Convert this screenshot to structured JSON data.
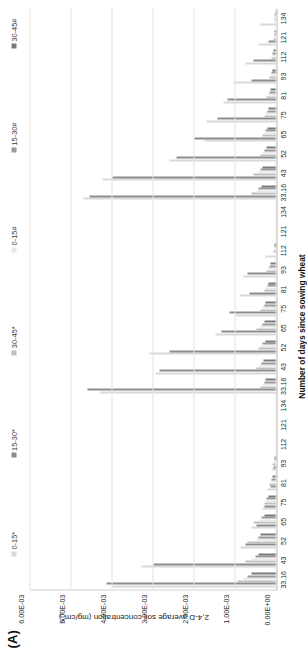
{
  "panel": {
    "label": "(A)"
  },
  "chart_data": {
    "type": "bar",
    "title": "",
    "xlabel": "Number of days since sowing wheat",
    "ylabel": "2,4-D average soil concentration (mg/cm",
    "ylabel_sup": "2",
    "ylabel_tail": ")",
    "ylabel_full": "2,4-D average soil concentration (mg/cm²)",
    "ylim": [
      0,
      0.006
    ],
    "ytick_labels": [
      "6.00E-03",
      "5.00E-03",
      "4.00E-03",
      "3.00E-03",
      "2.00E-03",
      "1.00E-03",
      "0.00E+00"
    ],
    "ytick_values": [
      0.006,
      0.005,
      0.004,
      0.003,
      0.002,
      0.001,
      0
    ],
    "grid": true,
    "legend_position": "top",
    "categories": [
      "33.16",
      "43",
      "52",
      "65",
      "75",
      "81",
      "93",
      "112",
      "121",
      "134",
      "33.16",
      "43",
      "52",
      "65",
      "75",
      "81",
      "93",
      "112",
      "121",
      "134",
      "33.16",
      "43",
      "52",
      "65",
      "75",
      "81",
      "93",
      "112",
      "121",
      "134"
    ],
    "series": [
      {
        "name": "0-15*",
        "color": "#d9d9d9",
        "values": [
          0.004,
          0.0033,
          0.00088,
          0.0006,
          0.00035,
          0.00022,
          0.00012,
          0.0,
          0.0,
          0.0,
          0.0043,
          0.00295,
          0.0031,
          0.0015,
          0.001,
          0.0009,
          0.0008,
          0.00028,
          0.0,
          0.0,
          0.0047,
          0.00425,
          0.0026,
          0.00175,
          0.0017,
          0.0013,
          0.00105,
          0.00075,
          0.00045,
          0.0004
        ]
      },
      {
        "name": "15-30*",
        "color": "#8c8c8c",
        "values": [
          0.00415,
          0.003,
          0.00075,
          0.0005,
          0.0003,
          0.00015,
          8e-05,
          0.0,
          0.0,
          0.0,
          0.0046,
          0.00285,
          0.0026,
          0.00135,
          0.00115,
          0.00065,
          0.0007,
          0.0,
          0.0,
          0.0,
          0.00455,
          0.004,
          0.00245,
          0.002,
          0.00145,
          0.0012,
          0.0006,
          0.00055,
          0.0002,
          0.0
        ]
      },
      {
        "name": "30-45*",
        "color": "#bfbfbf",
        "values": [
          0.00095,
          0.00075,
          0.0007,
          0.00055,
          0.0003,
          0.00018,
          0.0001,
          0.0,
          0.0,
          0.0,
          0.0004,
          0.0005,
          0.00045,
          0.00048,
          0.0004,
          0.0003,
          0.00025,
          8e-05,
          0.0,
          0.0,
          0.0006,
          0.00055,
          0.0004,
          0.00035,
          0.0003,
          0.00025,
          0.00018,
          0.00012,
          8e-05,
          6e-05
        ]
      },
      {
        "name": "0-15#",
        "color": "#e8e8e8",
        "values": [
          0.0008,
          0.0006,
          0.0005,
          0.00042,
          0.00028,
          0.00014,
          7e-05,
          0.0,
          0.0,
          0.0,
          0.00035,
          0.00042,
          0.00038,
          0.0004,
          0.00035,
          0.00026,
          0.0002,
          6e-05,
          0.0,
          0.0,
          0.0005,
          0.00045,
          0.00034,
          0.0003,
          0.00026,
          0.0002,
          0.00015,
          0.0001,
          7e-05,
          5e-05
        ]
      },
      {
        "name": "15-30#",
        "color": "#999999",
        "values": [
          0.0007,
          0.00052,
          0.00044,
          0.00036,
          0.00024,
          0.00012,
          6e-05,
          0.0,
          0.0,
          0.0,
          0.0003,
          0.00036,
          0.00033,
          0.00034,
          0.0003,
          0.00022,
          0.00017,
          5e-05,
          0.0,
          0.0,
          0.00043,
          0.00038,
          0.00029,
          0.00026,
          0.00022,
          0.00017,
          0.00013,
          9e-05,
          6e-05,
          4e-05
        ]
      },
      {
        "name": "30-45#",
        "color": "#7a7a7a",
        "values": [
          0.0006,
          0.00045,
          0.00038,
          0.0003,
          0.0002,
          0.0001,
          5e-05,
          0.0,
          0.0,
          0.0,
          0.00026,
          0.00031,
          0.00028,
          0.00029,
          0.00026,
          0.00019,
          0.00014,
          4e-05,
          0.0,
          0.0,
          0.00037,
          0.00033,
          0.00025,
          0.00022,
          0.00019,
          0.00014,
          0.00011,
          8e-05,
          5e-05,
          3e-05
        ]
      }
    ]
  }
}
